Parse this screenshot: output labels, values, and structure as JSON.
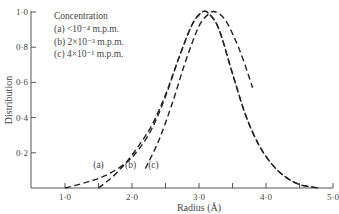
{
  "chart_data": {
    "type": "line",
    "title": "",
    "xlabel": "Radius (Å)",
    "ylabel": "Distribution",
    "xlim": [
      0.5,
      5.0
    ],
    "ylim": [
      0,
      1.0
    ],
    "grid": false,
    "x_ticks": [
      "1·0",
      "2·0",
      "3·0",
      "4·0",
      "5·0"
    ],
    "x_tick_values": [
      1.0,
      2.0,
      3.0,
      4.0,
      5.0
    ],
    "x_minor_ticks": [
      1.5,
      2.5,
      3.5,
      4.5
    ],
    "y_ticks": [
      "0·2",
      "0·4",
      "0·6",
      "0·8",
      "1·0"
    ],
    "y_tick_values": [
      0.2,
      0.4,
      0.6,
      0.8,
      1.0
    ],
    "line_style": "dashed",
    "legend": {
      "title": "Concentration",
      "position": "upper-left",
      "entries": [
        {
          "label": "(a)",
          "text": "<10⁻⁴ m.p.m."
        },
        {
          "label": "(b)",
          "text": "2×10⁻³ m.p.m."
        },
        {
          "label": "(c)",
          "text": "4×10⁻¹ m.p.m."
        }
      ]
    },
    "series": [
      {
        "name": "(a) <10⁻⁴ m.p.m.",
        "note": "curves (a) and (b) merge above ~0.3 and share the descending branch",
        "x": [
          1.0,
          1.3,
          1.6,
          1.9,
          2.1,
          2.3,
          2.5,
          2.7,
          2.9,
          3.05,
          3.15,
          3.3,
          3.5,
          3.7,
          3.9,
          4.1,
          4.3,
          4.5,
          4.7,
          4.8
        ],
        "y": [
          0.0,
          0.03,
          0.07,
          0.14,
          0.22,
          0.34,
          0.52,
          0.74,
          0.93,
          1.0,
          0.99,
          0.9,
          0.65,
          0.41,
          0.24,
          0.13,
          0.06,
          0.02,
          0.005,
          0.0
        ]
      },
      {
        "name": "(b) 2×10⁻³ m.p.m.",
        "x": [
          1.5,
          1.7,
          1.9,
          2.1,
          2.3,
          2.5,
          2.7,
          2.9,
          3.05,
          3.15,
          3.3,
          3.5,
          3.7,
          3.9,
          4.1,
          4.3,
          4.5,
          4.7,
          4.8
        ],
        "y": [
          0.0,
          0.06,
          0.14,
          0.24,
          0.36,
          0.53,
          0.74,
          0.93,
          1.0,
          0.99,
          0.9,
          0.65,
          0.41,
          0.24,
          0.13,
          0.06,
          0.02,
          0.005,
          0.0
        ]
      },
      {
        "name": "(c) 4×10⁻¹ m.p.m.",
        "x": [
          2.2,
          2.4,
          2.6,
          2.8,
          3.0,
          3.15,
          3.25,
          3.4,
          3.6,
          3.8
        ],
        "y": [
          0.11,
          0.27,
          0.48,
          0.72,
          0.92,
          0.99,
          1.0,
          0.95,
          0.79,
          0.57
        ]
      }
    ],
    "curve_labels": [
      {
        "text": "(a)",
        "x": 1.5,
        "y": 0.1
      },
      {
        "text": "(b)",
        "x": 1.98,
        "y": 0.1
      },
      {
        "text": "(c)",
        "x": 2.32,
        "y": 0.1
      }
    ]
  }
}
